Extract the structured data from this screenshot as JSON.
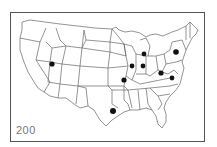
{
  "map": {
    "subject": "Contiguous United States outline map with state borders",
    "label": "200",
    "marker_color": "#111111",
    "line_color": "#666666",
    "markers": [
      {
        "id": "utah",
        "region": "Utah",
        "x": 52,
        "y": 64
      },
      {
        "id": "texas-louisiana",
        "region": "East Texas",
        "x": 113,
        "y": 111
      },
      {
        "id": "missouri",
        "region": "Missouri",
        "x": 124,
        "y": 80
      },
      {
        "id": "illinois",
        "region": "Illinois",
        "x": 132,
        "y": 66
      },
      {
        "id": "indiana",
        "region": "Indiana",
        "x": 143,
        "y": 66
      },
      {
        "id": "michigan",
        "region": "Michigan",
        "x": 144,
        "y": 54
      },
      {
        "id": "west-virginia",
        "region": "West Virginia",
        "x": 161,
        "y": 73
      },
      {
        "id": "virginia",
        "region": "Virginia",
        "x": 172,
        "y": 78
      },
      {
        "id": "new-york",
        "region": "New York",
        "x": 176,
        "y": 52
      }
    ]
  }
}
